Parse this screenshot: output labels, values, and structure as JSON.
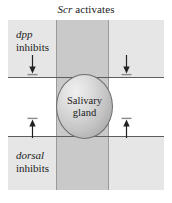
{
  "figure": {
    "title": {
      "gene": "Scr",
      "verb": "activates"
    },
    "gland": {
      "line1": "Salivary",
      "line2": "gland"
    },
    "labels": [
      {
        "id": "dpp",
        "gene": "dpp",
        "verb": "inhibits",
        "position": "top-left"
      },
      {
        "id": "dorsal",
        "gene": "dorsal",
        "verb": "inhibits",
        "position": "bottom-left"
      }
    ],
    "arrows": [
      {
        "id": "top-left",
        "direction": "down"
      },
      {
        "id": "top-right",
        "direction": "down"
      },
      {
        "id": "bottom-left",
        "direction": "up"
      },
      {
        "id": "bottom-right",
        "direction": "up"
      }
    ],
    "colors": {
      "outer_field": "#e6e6e6",
      "vertical_band": "#c9c9c9",
      "middle_stripe": "#ffffff",
      "rule": "#5d5d5d",
      "gland_outline": "#6e6e6e",
      "text": "#1a1a1a"
    }
  }
}
